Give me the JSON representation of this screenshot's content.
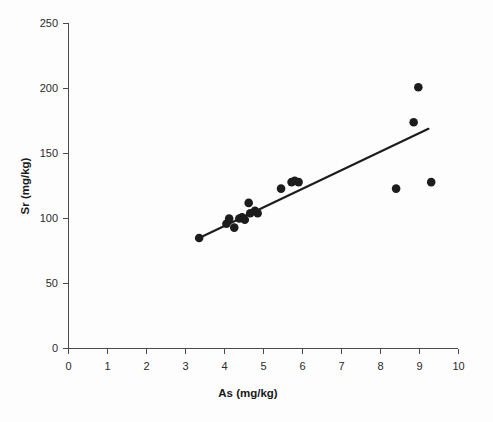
{
  "chart_data": {
    "type": "scatter",
    "title": "",
    "xlabel": "As (mg/kg)",
    "ylabel": "Sr (mg/kg)",
    "xlim": [
      0,
      10
    ],
    "ylim": [
      0,
      250
    ],
    "xticks": [
      0,
      1,
      2,
      3,
      4,
      5,
      6,
      7,
      8,
      9,
      10
    ],
    "yticks": [
      0,
      50,
      100,
      150,
      200,
      250
    ],
    "xtick_labels": [
      "0",
      "1",
      "2",
      "3",
      "4",
      "5",
      "6",
      "7",
      "8",
      "9",
      "10"
    ],
    "ytick_labels": [
      "0",
      "50",
      "100",
      "150",
      "200",
      "250"
    ],
    "grid": false,
    "legend": null,
    "marker": "filled-circle",
    "marker_color": "#1c1c1c",
    "points": [
      {
        "x": 3.35,
        "y": 85
      },
      {
        "x": 4.05,
        "y": 96
      },
      {
        "x": 4.12,
        "y": 100
      },
      {
        "x": 4.25,
        "y": 93
      },
      {
        "x": 4.38,
        "y": 100
      },
      {
        "x": 4.45,
        "y": 101
      },
      {
        "x": 4.52,
        "y": 99
      },
      {
        "x": 4.62,
        "y": 112
      },
      {
        "x": 4.66,
        "y": 104
      },
      {
        "x": 4.78,
        "y": 106
      },
      {
        "x": 4.85,
        "y": 104
      },
      {
        "x": 5.45,
        "y": 123
      },
      {
        "x": 5.72,
        "y": 128
      },
      {
        "x": 5.8,
        "y": 129
      },
      {
        "x": 5.9,
        "y": 128
      },
      {
        "x": 8.4,
        "y": 123
      },
      {
        "x": 8.85,
        "y": 174
      },
      {
        "x": 8.97,
        "y": 201
      },
      {
        "x": 9.3,
        "y": 128
      }
    ],
    "fit_line": {
      "type": "linear-regression",
      "x_start": 3.35,
      "y_start": 85,
      "x_end": 9.23,
      "y_end": 169
    }
  }
}
